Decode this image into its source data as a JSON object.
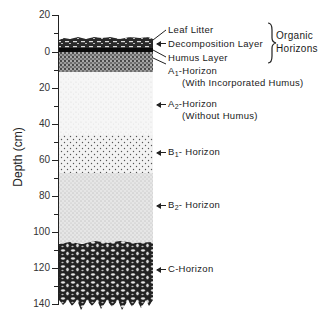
{
  "axis": {
    "label": "Depth (cm)",
    "ticks": [
      {
        "label": "20",
        "y": 15
      },
      {
        "label": "0",
        "y": 52
      },
      {
        "label": "20",
        "y": 88
      },
      {
        "label": "40",
        "y": 124
      },
      {
        "label": "60",
        "y": 160
      },
      {
        "label": "80",
        "y": 196
      },
      {
        "label": "100",
        "y": 232
      },
      {
        "label": "120",
        "y": 268
      },
      {
        "label": "140",
        "y": 304
      }
    ]
  },
  "layers": [
    {
      "name": "Leaf Litter",
      "top_cm": -8,
      "bottom_cm": -4
    },
    {
      "name": "Decomposition Layer",
      "top_cm": -4,
      "bottom_cm": -1
    },
    {
      "name": "Humus Layer",
      "top_cm": -1,
      "bottom_cm": 0
    },
    {
      "name": "A1-Horizon",
      "top_cm": 0,
      "bottom_cm": 11
    },
    {
      "name": "A2-Horizon",
      "top_cm": 11,
      "bottom_cm": 46
    },
    {
      "name": "B1-Horizon",
      "top_cm": 46,
      "bottom_cm": 67
    },
    {
      "name": "B2-Horizon",
      "top_cm": 67,
      "bottom_cm": 106
    },
    {
      "name": "C-Horizon",
      "top_cm": 106,
      "bottom_cm": 140
    }
  ],
  "labels": {
    "leaf_litter": "Leaf Litter",
    "decomposition": "Decomposition Layer",
    "humus": "Humus Layer",
    "organic_group": "Organic",
    "organic_group2": "Horizons",
    "a1_main": "A",
    "a1_sub": "1",
    "a1_rest": "-Horizon",
    "a1_note": "(With Incorporated Humus)",
    "a2_main": "A",
    "a2_sub": "2",
    "a2_rest": "-Horizon",
    "a2_note": "(Without Humus)",
    "b1_main": "B",
    "b1_sub": "1",
    "b1_rest": "- Horizon",
    "b2_main": "B",
    "b2_sub": "2",
    "b2_rest": "- Horizon",
    "c": "C-Horizon"
  }
}
